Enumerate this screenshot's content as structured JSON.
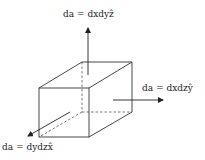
{
  "diagram": {
    "title": "",
    "labels": {
      "top": "da = dxdyẑ",
      "right": "da = dxdzŷ",
      "left": "da = dydzx̂"
    },
    "colors": {
      "line": "#333333",
      "dashed": "#555555",
      "text": "#222222"
    }
  }
}
